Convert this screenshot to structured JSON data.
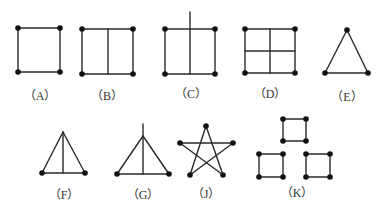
{
  "colors": {
    "line": "#2a2a2a",
    "vertex": "#111111",
    "label": "#333333",
    "background": "#ffffff"
  },
  "figures": [
    {
      "id": "A",
      "label": "（A）",
      "label_pos": [
        40,
        100
      ],
      "vertices": [
        [
          18,
          28
        ],
        [
          60,
          28
        ],
        [
          60,
          72
        ],
        [
          18,
          72
        ]
      ],
      "edges": [
        [
          [
            18,
            28
          ],
          [
            60,
            28
          ]
        ],
        [
          [
            60,
            28
          ],
          [
            60,
            72
          ]
        ],
        [
          [
            60,
            72
          ],
          [
            18,
            72
          ]
        ],
        [
          [
            18,
            72
          ],
          [
            18,
            28
          ]
        ]
      ]
    },
    {
      "id": "B",
      "label": "（B）",
      "label_pos": [
        107,
        100
      ],
      "vertices": [
        [
          82,
          29
        ],
        [
          133,
          29
        ],
        [
          133,
          74
        ],
        [
          82,
          74
        ]
      ],
      "edges": [
        [
          [
            82,
            29
          ],
          [
            133,
            29
          ]
        ],
        [
          [
            133,
            29
          ],
          [
            133,
            74
          ]
        ],
        [
          [
            133,
            74
          ],
          [
            82,
            74
          ]
        ],
        [
          [
            82,
            74
          ],
          [
            82,
            29
          ]
        ],
        [
          [
            108,
            29
          ],
          [
            108,
            74
          ]
        ]
      ]
    },
    {
      "id": "C",
      "label": "（C）",
      "label_pos": [
        191,
        98
      ],
      "vertices": [
        [
          165,
          29
        ],
        [
          215,
          29
        ],
        [
          215,
          74
        ],
        [
          165,
          74
        ]
      ],
      "edges": [
        [
          [
            165,
            29
          ],
          [
            215,
            29
          ]
        ],
        [
          [
            215,
            29
          ],
          [
            215,
            74
          ]
        ],
        [
          [
            215,
            74
          ],
          [
            165,
            74
          ]
        ],
        [
          [
            165,
            74
          ],
          [
            165,
            29
          ]
        ],
        [
          [
            190,
            12
          ],
          [
            190,
            74
          ]
        ]
      ]
    },
    {
      "id": "D",
      "label": "（D）",
      "label_pos": [
        270,
        98
      ],
      "vertices": [
        [
          245,
          29
        ],
        [
          295,
          29
        ],
        [
          295,
          73
        ],
        [
          245,
          73
        ]
      ],
      "edges": [
        [
          [
            245,
            29
          ],
          [
            295,
            29
          ]
        ],
        [
          [
            295,
            29
          ],
          [
            295,
            73
          ]
        ],
        [
          [
            295,
            73
          ],
          [
            245,
            73
          ]
        ],
        [
          [
            245,
            73
          ],
          [
            245,
            29
          ]
        ],
        [
          [
            270,
            29
          ],
          [
            270,
            73
          ]
        ],
        [
          [
            245,
            51
          ],
          [
            295,
            51
          ]
        ]
      ]
    },
    {
      "id": "E",
      "label": "（E）",
      "label_pos": [
        347,
        101
      ],
      "vertices": [
        [
          347,
          30
        ],
        [
          368,
          73
        ],
        [
          325,
          73
        ]
      ],
      "edges": [
        [
          [
            347,
            30
          ],
          [
            368,
            73
          ]
        ],
        [
          [
            368,
            73
          ],
          [
            325,
            73
          ]
        ],
        [
          [
            325,
            73
          ],
          [
            347,
            30
          ]
        ]
      ]
    },
    {
      "id": "F",
      "label": "（F）",
      "label_pos": [
        64,
        199
      ],
      "vertices": [
        [
          42,
          173
        ],
        [
          85,
          173
        ]
      ],
      "edges": [
        [
          [
            63,
            132
          ],
          [
            42,
            173
          ]
        ],
        [
          [
            63,
            132
          ],
          [
            85,
            173
          ]
        ],
        [
          [
            42,
            173
          ],
          [
            85,
            173
          ]
        ],
        [
          [
            63,
            132
          ],
          [
            63,
            173
          ]
        ]
      ]
    },
    {
      "id": "G",
      "label": "（G）",
      "label_pos": [
        143,
        199
      ],
      "vertices": [
        [
          117,
          174
        ],
        [
          169,
          174
        ]
      ],
      "edges": [
        [
          [
            143,
            136
          ],
          [
            117,
            174
          ]
        ],
        [
          [
            143,
            136
          ],
          [
            169,
            174
          ]
        ],
        [
          [
            117,
            174
          ],
          [
            169,
            174
          ]
        ],
        [
          [
            143,
            124
          ],
          [
            143,
            174
          ]
        ]
      ]
    },
    {
      "id": "J",
      "label": "（J）",
      "label_pos": [
        206,
        198
      ],
      "vertices": [
        [
          206,
          126
        ],
        [
          180,
          143
        ],
        [
          233,
          143
        ],
        [
          190,
          175
        ],
        [
          223,
          175
        ]
      ],
      "edges": [
        [
          [
            206,
            126
          ],
          [
            190,
            175
          ]
        ],
        [
          [
            190,
            175
          ],
          [
            233,
            143
          ]
        ],
        [
          [
            233,
            143
          ],
          [
            180,
            143
          ]
        ],
        [
          [
            180,
            143
          ],
          [
            223,
            175
          ]
        ],
        [
          [
            223,
            175
          ],
          [
            206,
            126
          ]
        ]
      ]
    },
    {
      "id": "K",
      "label": "（K）",
      "label_pos": [
        297,
        197
      ],
      "vertices": [
        [
          283,
          119
        ],
        [
          306,
          119
        ],
        [
          306,
          141
        ],
        [
          283,
          141
        ],
        [
          259,
          154
        ],
        [
          283,
          154
        ],
        [
          283,
          177
        ],
        [
          259,
          177
        ],
        [
          306,
          154
        ],
        [
          330,
          154
        ],
        [
          330,
          177
        ],
        [
          306,
          177
        ]
      ],
      "edges": [
        [
          [
            283,
            119
          ],
          [
            306,
            119
          ]
        ],
        [
          [
            306,
            119
          ],
          [
            306,
            141
          ]
        ],
        [
          [
            306,
            141
          ],
          [
            283,
            141
          ]
        ],
        [
          [
            283,
            141
          ],
          [
            283,
            119
          ]
        ],
        [
          [
            259,
            154
          ],
          [
            283,
            154
          ]
        ],
        [
          [
            283,
            154
          ],
          [
            283,
            177
          ]
        ],
        [
          [
            283,
            177
          ],
          [
            259,
            177
          ]
        ],
        [
          [
            259,
            177
          ],
          [
            259,
            154
          ]
        ],
        [
          [
            306,
            154
          ],
          [
            330,
            154
          ]
        ],
        [
          [
            330,
            154
          ],
          [
            330,
            177
          ]
        ],
        [
          [
            330,
            177
          ],
          [
            306,
            177
          ]
        ],
        [
          [
            306,
            177
          ],
          [
            306,
            154
          ]
        ]
      ]
    }
  ]
}
